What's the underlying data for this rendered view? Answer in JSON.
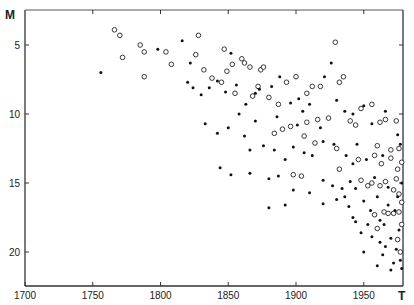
{
  "chart_data": {
    "type": "scatter",
    "title": "",
    "xlabel": "T",
    "ylabel": "M",
    "xlim": [
      1700,
      1980
    ],
    "ylim": [
      22,
      3
    ],
    "y_inverted": true,
    "grid": false,
    "legend": null,
    "x_ticks": [
      1700,
      1750,
      1800,
      1850,
      1900,
      1950
    ],
    "x_tick_labels": [
      "1700",
      "1750",
      "1800",
      "1850",
      "1900",
      "1950"
    ],
    "y_ticks": [
      5,
      10,
      15,
      20
    ],
    "y_tick_labels": [
      "5",
      "10",
      "15",
      "20"
    ],
    "marker_types": {
      "open": "open circle",
      "filled": "filled dot"
    },
    "series": [
      {
        "name": "open",
        "points": [
          [
            1766,
            3.9
          ],
          [
            1770,
            4.3
          ],
          [
            1785,
            5.0
          ],
          [
            1788,
            5.5
          ],
          [
            1772,
            5.9
          ],
          [
            1788,
            7.3
          ],
          [
            1804,
            5.5
          ],
          [
            1808,
            6.4
          ],
          [
            1828,
            4.3
          ],
          [
            1826,
            5.7
          ],
          [
            1832,
            6.8
          ],
          [
            1838,
            7.4
          ],
          [
            1847,
            5.3
          ],
          [
            1849,
            6.9
          ],
          [
            1853,
            6.4
          ],
          [
            1860,
            6.0
          ],
          [
            1862,
            6.3
          ],
          [
            1866,
            6.6
          ],
          [
            1874,
            6.8
          ],
          [
            1876,
            6.6
          ],
          [
            1845,
            7.7
          ],
          [
            1855,
            8.5
          ],
          [
            1872,
            8.0
          ],
          [
            1893,
            7.7
          ],
          [
            1900,
            7.3
          ],
          [
            1908,
            8.5
          ],
          [
            1918,
            8.0
          ],
          [
            1929,
            4.8
          ],
          [
            1932,
            7.7
          ],
          [
            1935,
            7.3
          ],
          [
            1948,
            9.6
          ],
          [
            1956,
            9.3
          ],
          [
            1940,
            10.5
          ],
          [
            1944,
            10.8
          ],
          [
            1916,
            10.4
          ],
          [
            1908,
            10.6
          ],
          [
            1896,
            10.9
          ],
          [
            1890,
            11.1
          ],
          [
            1884,
            11.4
          ],
          [
            1906,
            11.6
          ],
          [
            1962,
            10.6
          ],
          [
            1966,
            10.4
          ],
          [
            1974,
            10.5
          ],
          [
            1960,
            12.3
          ],
          [
            1914,
            12.1
          ],
          [
            1930,
            12.5
          ],
          [
            1946,
            13.3
          ],
          [
            1958,
            13.0
          ],
          [
            1963,
            13.6
          ],
          [
            1970,
            12.6
          ],
          [
            1976,
            12.5
          ],
          [
            1898,
            14.4
          ],
          [
            1904,
            14.5
          ],
          [
            1932,
            14.0
          ],
          [
            1948,
            14.8
          ],
          [
            1953,
            15.2
          ],
          [
            1956,
            15.0
          ],
          [
            1962,
            15.2
          ],
          [
            1966,
            14.9
          ],
          [
            1972,
            15.5
          ],
          [
            1974,
            14.7
          ],
          [
            1976,
            15.8
          ],
          [
            1978,
            16.4
          ],
          [
            1976,
            17.1
          ],
          [
            1958,
            17.3
          ],
          [
            1965,
            17.1
          ],
          [
            1968,
            17.2
          ],
          [
            1972,
            17.2
          ],
          [
            1978,
            18.0
          ],
          [
            1960,
            18.3
          ],
          [
            1975,
            19.1
          ],
          [
            1977,
            20.0
          ],
          [
            1970,
            13.2
          ],
          [
            1975,
            14.0
          ],
          [
            1978,
            13.5
          ],
          [
            1887,
            9.3
          ],
          [
            1912,
            8.0
          ],
          [
            1924,
            10.3
          ],
          [
            1880,
            8.8
          ],
          [
            1868,
            8.7
          ]
        ]
      },
      {
        "name": "filled",
        "points": [
          [
            1756,
            7.0
          ],
          [
            1798,
            5.3
          ],
          [
            1816,
            4.7
          ],
          [
            1822,
            6.3
          ],
          [
            1820,
            7.7
          ],
          [
            1824,
            8.1
          ],
          [
            1830,
            8.6
          ],
          [
            1836,
            8.1
          ],
          [
            1842,
            7.6
          ],
          [
            1852,
            5.6
          ],
          [
            1848,
            8.4
          ],
          [
            1856,
            7.9
          ],
          [
            1863,
            9.3
          ],
          [
            1858,
            10.0
          ],
          [
            1870,
            8.5
          ],
          [
            1873,
            8.2
          ],
          [
            1882,
            8.0
          ],
          [
            1888,
            7.3
          ],
          [
            1896,
            9.2
          ],
          [
            1902,
            8.9
          ],
          [
            1905,
            9.8
          ],
          [
            1910,
            9.3
          ],
          [
            1921,
            7.3
          ],
          [
            1926,
            6.3
          ],
          [
            1930,
            9.0
          ],
          [
            1936,
            9.8
          ],
          [
            1942,
            10.0
          ],
          [
            1950,
            9.4
          ],
          [
            1956,
            10.7
          ],
          [
            1966,
            9.8
          ],
          [
            1975,
            11.5
          ],
          [
            1977,
            12.2
          ],
          [
            1833,
            10.7
          ],
          [
            1842,
            11.4
          ],
          [
            1850,
            11.0
          ],
          [
            1862,
            11.6
          ],
          [
            1866,
            12.6
          ],
          [
            1876,
            12.3
          ],
          [
            1884,
            12.6
          ],
          [
            1892,
            13.3
          ],
          [
            1898,
            12.4
          ],
          [
            1906,
            12.8
          ],
          [
            1912,
            13.0
          ],
          [
            1920,
            12.0
          ],
          [
            1928,
            12.2
          ],
          [
            1937,
            13.0
          ],
          [
            1942,
            13.6
          ],
          [
            1952,
            13.3
          ],
          [
            1964,
            13.0
          ],
          [
            1844,
            13.9
          ],
          [
            1852,
            14.4
          ],
          [
            1866,
            14.3
          ],
          [
            1880,
            14.7
          ],
          [
            1887,
            14.5
          ],
          [
            1898,
            15.5
          ],
          [
            1910,
            15.7
          ],
          [
            1920,
            14.8
          ],
          [
            1927,
            15.2
          ],
          [
            1934,
            15.4
          ],
          [
            1940,
            14.9
          ],
          [
            1944,
            15.4
          ],
          [
            1950,
            16.3
          ],
          [
            1960,
            16.0
          ],
          [
            1968,
            16.6
          ],
          [
            1973,
            17.0
          ],
          [
            1965,
            18.0
          ],
          [
            1976,
            18.4
          ],
          [
            1956,
            18.9
          ],
          [
            1962,
            19.3
          ],
          [
            1970,
            19.0
          ],
          [
            1974,
            19.8
          ],
          [
            1977,
            20.6
          ],
          [
            1978,
            21.2
          ],
          [
            1972,
            20.8
          ],
          [
            1964,
            20.2
          ],
          [
            1950,
            20.0
          ],
          [
            1944,
            17.8
          ],
          [
            1939,
            16.7
          ],
          [
            1930,
            16.2
          ],
          [
            1920,
            16.5
          ],
          [
            1892,
            16.6
          ],
          [
            1880,
            16.8
          ],
          [
            1958,
            14.6
          ],
          [
            1945,
            12.2
          ],
          [
            1970,
            21.3
          ],
          [
            1966,
            19.6
          ],
          [
            1953,
            18.0
          ],
          [
            1948,
            18.6
          ],
          [
            1942,
            17.5
          ],
          [
            1960,
            21.0
          ],
          [
            1975,
            16.0
          ],
          [
            1978,
            15.0
          ],
          [
            1968,
            15.3
          ],
          [
            1955,
            17.0
          ],
          [
            1962,
            17.7
          ],
          [
            1936,
            16.0
          ],
          [
            1918,
            11.0
          ],
          [
            1901,
            10.8
          ],
          [
            1886,
            10.2
          ],
          [
            1870,
            10.5
          ]
        ]
      }
    ]
  },
  "axes": {
    "y_axis_label": "M",
    "x_axis_label": "T",
    "x_tick_labels": [
      "1700",
      "1750",
      "1800",
      "1850",
      "1900",
      "1950"
    ],
    "y_tick_labels": [
      "5",
      "10",
      "15",
      "20"
    ]
  }
}
